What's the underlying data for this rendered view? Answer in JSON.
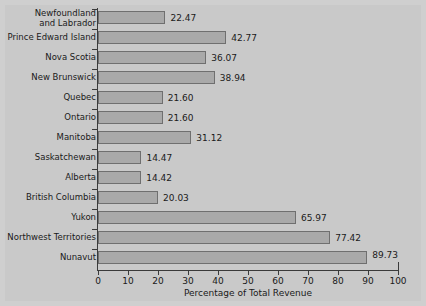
{
  "chart_data": {
    "type": "bar",
    "orientation": "horizontal",
    "title": "",
    "xlabel": "Percentage of Total Revenue",
    "ylabel": "",
    "xlim": [
      0,
      100
    ],
    "xticks": [
      0,
      10,
      20,
      30,
      40,
      50,
      60,
      70,
      80,
      90,
      100
    ],
    "grid": false,
    "legend": null,
    "bar_color": "#a9a9a9",
    "bar_edge_color": "#6f6f6f",
    "background_color": "#c9c9c9",
    "axis_color": "#3a3a3a",
    "categories": [
      "Newfoundland and Labrador",
      "Prince Edward Island",
      "Nova Scotia",
      "New Brunswick",
      "Quebec",
      "Ontario",
      "Manitoba",
      "Saskatchewan",
      "Alberta",
      "British Columbia",
      "Yukon",
      "Northwest Territories",
      "Nunavut"
    ],
    "values": [
      22.47,
      42.77,
      36.07,
      38.94,
      21.6,
      21.6,
      31.12,
      14.47,
      14.42,
      20.03,
      65.97,
      77.42,
      89.73
    ],
    "value_labels": [
      "22.47",
      "42.77",
      "36.07",
      "38.94",
      "21.60",
      "21.60",
      "31.12",
      "14.47",
      "14.42",
      "20.03",
      "65.97",
      "77.42",
      "89.73"
    ],
    "category_label_lines": [
      [
        "Newfoundland",
        "and Labrador"
      ],
      [
        "Prince Edward Island"
      ],
      [
        "Nova Scotia"
      ],
      [
        "New Brunswick"
      ],
      [
        "Quebec"
      ],
      [
        "Ontario"
      ],
      [
        "Manitoba"
      ],
      [
        "Saskatchewan"
      ],
      [
        "Alberta"
      ],
      [
        "British Columbia"
      ],
      [
        "Yukon"
      ],
      [
        "Northwest Territories"
      ],
      [
        "Nunavut"
      ]
    ]
  }
}
